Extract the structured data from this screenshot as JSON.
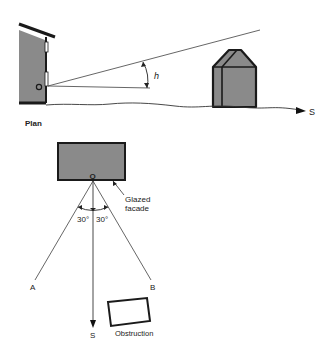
{
  "elevation": {
    "point_label": "O",
    "angle_label": "h",
    "direction_label": "S"
  },
  "plan": {
    "title": "Plan",
    "point_label": "O",
    "glazed_label_line1": "Glazed",
    "glazed_label_line2": "facade",
    "angle_left": "30°",
    "angle_right": "30°",
    "ray_a_label": "A",
    "ray_b_label": "B",
    "direction_label": "S",
    "obstruction_label": "Obstruction"
  },
  "colors": {
    "fill_gray": "#8a8a8a",
    "stroke": "#1a1a1a",
    "line": "#555555"
  }
}
